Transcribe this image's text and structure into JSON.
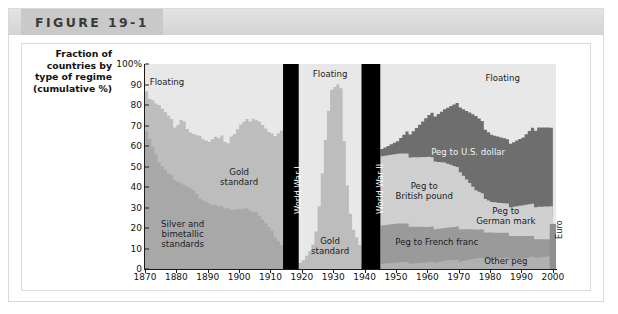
{
  "figure": {
    "title": "FIGURE 19-1"
  },
  "axis_caption": [
    "Fraction of",
    "countries by",
    "type of regime",
    "(cumulative %)"
  ],
  "chart_data": {
    "type": "area",
    "title": "FIGURE 19-1",
    "xlabel": "",
    "ylabel": "Fraction of countries by type of regime (cumulative %)",
    "xlim": [
      1870,
      2001
    ],
    "ylim": [
      0,
      100
    ],
    "grid": false,
    "legend_position": "inline-annotations",
    "ytick_labels": [
      "0",
      "10",
      "20",
      "30",
      "40",
      "50",
      "60",
      "70",
      "80",
      "90",
      "100%"
    ],
    "ytick_values": [
      0,
      10,
      20,
      30,
      40,
      50,
      60,
      70,
      80,
      90,
      100
    ],
    "xtick_labels": [
      "1870",
      "1880",
      "1890",
      "1900",
      "1910",
      "1920",
      "1930",
      "1940",
      "1950",
      "1960",
      "1970",
      "1980",
      "1990",
      "2000"
    ],
    "xtick_values": [
      1870,
      1880,
      1890,
      1900,
      1910,
      1920,
      1930,
      1940,
      1950,
      1960,
      1970,
      1980,
      1990,
      2000
    ],
    "annotations": [
      {
        "text": "Floating",
        "era": "pre-WWI",
        "x": 1877,
        "y": 91
      },
      {
        "text": "Gold standard",
        "era": "pre-WWI",
        "x": 1900,
        "y": 45
      },
      {
        "text": "Silver and bimetallic standards",
        "era": "pre-WWI",
        "x": 1882,
        "y": 17
      },
      {
        "text": "World War I",
        "era": "war-band",
        "x": 1916,
        "orientation": "vertical"
      },
      {
        "text": "Floating",
        "era": "interwar",
        "x": 1929,
        "y": 95
      },
      {
        "text": "Gold standard",
        "era": "interwar",
        "x": 1929,
        "y": 11
      },
      {
        "text": "World War II",
        "era": "war-band",
        "x": 1942,
        "orientation": "vertical"
      },
      {
        "text": "Floating",
        "era": "postwar",
        "x": 1984,
        "y": 93
      },
      {
        "text": "Peg to U.S. dollar",
        "era": "postwar",
        "x": 1973,
        "y": 57
      },
      {
        "text": "Peg to British pound",
        "era": "postwar",
        "x": 1959,
        "y": 38
      },
      {
        "text": "Peg to German mark",
        "era": "postwar",
        "x": 1985,
        "y": 26
      },
      {
        "text": "Peg to French franc",
        "era": "postwar",
        "x": 1963,
        "y": 13
      },
      {
        "text": "Other peg",
        "era": "postwar",
        "x": 1985,
        "y": 4
      },
      {
        "text": "Euro",
        "era": "postwar",
        "x": 1999,
        "orientation": "vertical"
      }
    ],
    "war_bands": [
      {
        "name": "World War I",
        "start": 1914,
        "end": 1919
      },
      {
        "name": "World War II",
        "start": 1939,
        "end": 1945
      }
    ],
    "series": [
      {
        "name": "Silver and bimetallic standards",
        "color": "#a8a8a8",
        "era": "pre-WWI",
        "x": [
          1870,
          1871,
          1872,
          1873,
          1874,
          1875,
          1876,
          1877,
          1878,
          1879,
          1880,
          1881,
          1882,
          1883,
          1884,
          1885,
          1886,
          1887,
          1888,
          1889,
          1890,
          1891,
          1892,
          1893,
          1894,
          1895,
          1896,
          1897,
          1898,
          1899,
          1900,
          1901,
          1902,
          1903,
          1904,
          1905,
          1906,
          1907,
          1908,
          1909,
          1910,
          1911,
          1912,
          1913,
          1914
        ],
        "values": [
          68,
          64,
          60,
          56,
          52,
          50,
          48,
          46,
          45,
          44,
          43,
          42,
          41,
          40,
          39,
          38,
          36,
          35,
          34,
          33,
          32,
          31,
          31,
          30,
          30,
          30,
          30,
          29,
          29,
          29,
          29,
          29,
          29,
          29,
          28,
          28,
          26,
          24,
          22,
          20,
          18,
          16,
          14,
          12,
          11
        ]
      },
      {
        "name": "Gold standard",
        "color": "#bdbdbd",
        "era": "pre-WWI",
        "x": [
          1870,
          1871,
          1872,
          1873,
          1874,
          1875,
          1876,
          1877,
          1878,
          1879,
          1880,
          1881,
          1882,
          1883,
          1884,
          1885,
          1886,
          1887,
          1888,
          1889,
          1890,
          1891,
          1892,
          1893,
          1894,
          1895,
          1896,
          1897,
          1898,
          1899,
          1900,
          1901,
          1902,
          1903,
          1904,
          1905,
          1906,
          1907,
          1908,
          1909,
          1910,
          1911,
          1912,
          1913,
          1914
        ],
        "values": [
          88,
          84,
          83,
          81,
          80,
          78,
          76,
          74,
          72,
          70,
          71,
          73,
          72,
          68,
          66,
          65,
          64,
          66,
          64,
          63,
          62,
          63,
          64,
          63,
          64,
          63,
          62,
          65,
          66,
          68,
          70,
          71,
          72,
          73,
          74,
          73,
          72,
          70,
          68,
          66,
          65,
          66,
          67,
          68,
          66
        ]
      },
      {
        "name": "Floating",
        "color": "#e8e8e8",
        "era": "pre-WWI",
        "note": "top band, remainder to 100%",
        "x": [
          1870,
          1880,
          1890,
          1900,
          1910,
          1914
        ],
        "values": [
          100,
          100,
          100,
          100,
          100,
          100
        ]
      },
      {
        "name": "Gold standard",
        "color": "#bdbdbd",
        "era": "interwar",
        "x": [
          1919,
          1920,
          1921,
          1922,
          1923,
          1924,
          1925,
          1926,
          1927,
          1928,
          1929,
          1930,
          1931,
          1932,
          1933,
          1934,
          1935,
          1936,
          1937,
          1938,
          1939
        ],
        "values": [
          4,
          5,
          7,
          9,
          12,
          18,
          30,
          46,
          62,
          78,
          88,
          89,
          90,
          88,
          62,
          40,
          26,
          20,
          16,
          12,
          10
        ]
      },
      {
        "name": "Floating",
        "color": "#e8e8e8",
        "era": "interwar",
        "note": "top band, remainder to 100%",
        "x": [
          1919,
          1929,
          1939
        ],
        "values": [
          100,
          100,
          100
        ]
      },
      {
        "name": "Other peg",
        "color": "#b0b0b0",
        "era": "postwar",
        "x": [
          1945,
          1950,
          1955,
          1960,
          1965,
          1970,
          1975,
          1980,
          1985,
          1990,
          1995,
          2000
        ],
        "values": [
          3,
          3,
          3,
          3,
          4,
          4,
          5,
          5,
          5,
          5,
          6,
          6
        ]
      },
      {
        "name": "Peg to French franc",
        "color": "#9a9a9a",
        "era": "postwar",
        "x": [
          1945,
          1950,
          1955,
          1960,
          1965,
          1970,
          1975,
          1980,
          1985,
          1990,
          1995,
          2000
        ],
        "values": [
          22,
          22,
          21,
          20,
          20,
          20,
          19,
          18,
          17,
          16,
          15,
          14
        ]
      },
      {
        "name": "Peg to German mark",
        "color": "#d0d0d0",
        "era": "postwar",
        "x": [
          1945,
          1950,
          1955,
          1960,
          1965,
          1970,
          1975,
          1980,
          1985,
          1990,
          1995,
          1998,
          2000
        ],
        "values": [
          22,
          22,
          21,
          20,
          20,
          21,
          26,
          28,
          30,
          30,
          30,
          30,
          22
        ]
      },
      {
        "name": "Peg to British pound",
        "color": "#cfcfcf",
        "era": "postwar",
        "x": [
          1945,
          1950,
          1955,
          1960,
          1965,
          1970,
          1975,
          1980,
          1985,
          1990,
          1995,
          2000
        ],
        "values": [
          56,
          56,
          55,
          54,
          52,
          48,
          38,
          33,
          31,
          31,
          31,
          30
        ]
      },
      {
        "name": "Peg to U.S. dollar",
        "color": "#6e6e6e",
        "era": "postwar",
        "x": [
          1945,
          1950,
          1955,
          1960,
          1965,
          1970,
          1975,
          1980,
          1985,
          1990,
          1995,
          2000
        ],
        "values": [
          60,
          62,
          68,
          74,
          78,
          80,
          74,
          66,
          62,
          64,
          70,
          68
        ]
      },
      {
        "name": "Floating",
        "color": "#e8e8e8",
        "era": "postwar",
        "note": "top band, remainder to 100%",
        "x": [
          1945,
          1970,
          2000
        ],
        "values": [
          100,
          100,
          100
        ]
      },
      {
        "name": "Euro",
        "color": "#8f8f8f",
        "era": "postwar",
        "x": [
          1999,
          2000
        ],
        "values": [
          22,
          22
        ]
      }
    ]
  },
  "colors": {
    "floating": "#e8e8e8",
    "gold_standard": "#bdbdbd",
    "silver_bimetallic": "#a8a8a8",
    "peg_us_dollar": "#6e6e6e",
    "peg_british_pound": "#cfcfcf",
    "peg_german_mark": "#d0d0d0",
    "peg_french_franc": "#9a9a9a",
    "other_peg": "#b0b0b0",
    "euro": "#8f8f8f",
    "war_band": "#000000",
    "header": "#c9c9c9"
  }
}
